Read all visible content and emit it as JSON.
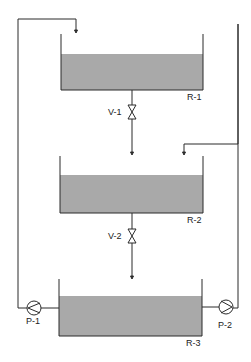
{
  "diagram": {
    "type": "process-flow",
    "colors": {
      "line": "#2a2a2a",
      "liquid": "#a9a9a9",
      "background": "#ffffff"
    },
    "reactors": [
      {
        "id": "R-1",
        "label": "R-1"
      },
      {
        "id": "R-2",
        "label": "R-2"
      },
      {
        "id": "R-3",
        "label": "R-3"
      }
    ],
    "valves": [
      {
        "id": "V-1",
        "label": "V-1"
      },
      {
        "id": "V-2",
        "label": "V-2"
      }
    ],
    "pumps": [
      {
        "id": "P-1",
        "label": "P-1"
      },
      {
        "id": "P-2",
        "label": "P-2"
      }
    ],
    "connections": [
      "R-1 -> V-1 -> R-2",
      "R-2 -> V-2 -> R-3",
      "R-3 -> P-1 -> R-1",
      "R-3 -> P-2 -> R-2"
    ]
  }
}
